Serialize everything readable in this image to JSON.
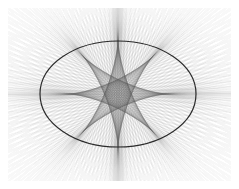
{
  "figure": {
    "caption": "",
    "width": 239,
    "height": 189,
    "background_color": "#ffffff"
  },
  "colors": {
    "background": "#ffffff",
    "ellipse_stroke": "#1a1a1a",
    "ray_stroke": "#555555",
    "envelope_shade": "#6a6a6a",
    "axis_band": "#888888"
  },
  "ellipse": {
    "name": "bounding-ellipse",
    "center_x": 118,
    "center_y": 94,
    "semi_major_a": 78,
    "semi_minor_b": 53,
    "stroke_width": 1.2,
    "stroke_color": "#1a1a1a",
    "fill": "none"
  },
  "astroid": {
    "name": "astroid-envelope",
    "center_x": 118,
    "center_y": 94,
    "cusp_half_width": 50,
    "cusp_half_height": 54,
    "cusp_count": 4,
    "cusps": [
      {
        "label": "top-cusp",
        "x": 118,
        "y": 40
      },
      {
        "label": "right-cusp",
        "x": 168,
        "y": 94
      },
      {
        "label": "bottom-cusp",
        "x": 118,
        "y": 148
      },
      {
        "label": "left-cusp",
        "x": 68,
        "y": 94
      }
    ]
  },
  "rays": {
    "name": "chord-family",
    "count": 180,
    "stroke_width": 0.35,
    "base_opacity": 0.34,
    "extension_length": 240,
    "description": "Family of chords of the ellipse extended to rays; their envelope traces the four-cusped astroid."
  },
  "drawing_bounds": {
    "left": 8,
    "top": 8,
    "right": 231,
    "bottom": 181
  },
  "chart_data": {
    "type": "line",
    "xlabel": "",
    "ylabel": "",
    "xlim": [
      -1.55,
      1.55
    ],
    "ylim": [
      -1.75,
      1.75
    ],
    "grid": false,
    "legend": "none",
    "series": [
      {
        "name": "ellipse",
        "equation": "x^2/a^2 + y^2/b^2 = 1",
        "a": 1.0,
        "b": 0.6795,
        "stroke": "#1a1a1a"
      },
      {
        "name": "astroid-envelope",
        "equation": "x^(2/3) + y^(2/3) = c^(2/3)",
        "half_width": 0.641,
        "half_height": 0.692,
        "stroke": "#6a6a6a"
      },
      {
        "name": "chord-rays",
        "count": 180,
        "stroke": "#555555"
      }
    ]
  }
}
